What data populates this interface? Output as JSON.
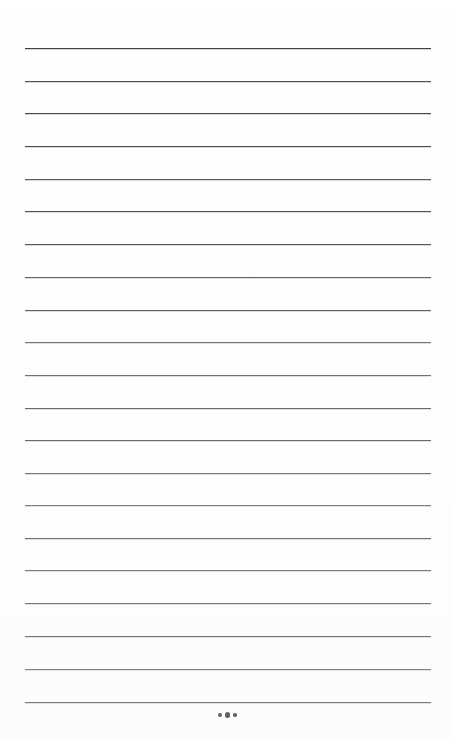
{
  "document": {
    "kind": "ruled-writing-page",
    "title": "",
    "background_color": "#ffffff",
    "page_width": 453,
    "page_height": 739,
    "body_text": "",
    "notes": "blank lined notebook page with no written content"
  },
  "ruling": {
    "line_color": "#3b3b3f",
    "line_thickness_px": 1,
    "line_left_px": 25,
    "line_right_px": 431,
    "line_width_px": 406,
    "first_line_y_px": 48,
    "line_spacing_px": 32.7,
    "line_count": 21,
    "line_positions_y": [
      48,
      81,
      113,
      146,
      179,
      211,
      244,
      277,
      310,
      342,
      375,
      408,
      440,
      473,
      505,
      538,
      570,
      603,
      636,
      669,
      702
    ]
  },
  "ornament": {
    "name": "three-dot-ellipsis",
    "symbol": "•••",
    "dot_count": 3,
    "color": "#141418",
    "center_x_px": 227,
    "center_y_px": 715,
    "dot_sizes_px": [
      4,
      5.5,
      3.5
    ]
  }
}
